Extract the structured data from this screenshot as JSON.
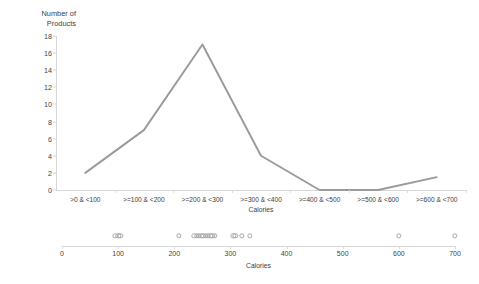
{
  "chart_data": {
    "type": "line",
    "title": "",
    "xlabel": "Calories",
    "ylabel": "Number of Products",
    "categories": [
      ">0 & <100",
      ">=100 & <200",
      ">=200 & <300",
      ">=300 & <400",
      ">=400 & <500",
      ">=500 & <600",
      ">=600 & <700"
    ],
    "values": [
      2,
      7,
      17,
      4,
      0,
      0,
      1.5
    ],
    "ylim": [
      0,
      18
    ],
    "yticks": [
      0,
      2,
      4,
      6,
      8,
      10,
      12,
      14,
      16,
      18
    ],
    "grid": false,
    "legend": false,
    "line_color": "#9a9a9a",
    "secondary_chart": {
      "type": "scatter",
      "xlabel": "Calories",
      "xlim": [
        0,
        700
      ],
      "xticks": [
        0,
        100,
        200,
        300,
        400,
        500,
        600,
        700
      ],
      "marker": "open-circle",
      "marker_color": "#a8a8a8",
      "points": [
        95,
        100,
        104,
        208,
        236,
        240,
        244,
        248,
        252,
        256,
        260,
        264,
        268,
        272,
        305,
        309,
        320,
        334,
        600,
        700
      ]
    }
  },
  "axis_titles": {
    "y": "Number of\nProducts",
    "x_categories": "Calories",
    "x_dot": "Calories"
  }
}
